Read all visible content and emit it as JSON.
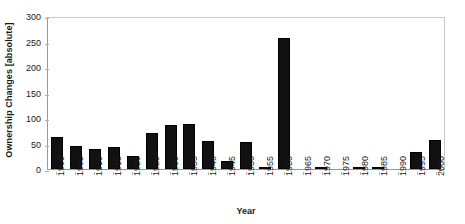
{
  "chart_data": {
    "type": "bar",
    "title": "",
    "xlabel": "Year",
    "ylabel": "Ownership Changes [absolute]",
    "categories": [
      "1900",
      "1905",
      "1910",
      "1915",
      "1920",
      "1925",
      "1930",
      "1935",
      "1940",
      "1945",
      "1950",
      "1955",
      "1960",
      "1965",
      "1970",
      "1975",
      "1980",
      "1985",
      "1990",
      "1995",
      "2000"
    ],
    "values": [
      63,
      46,
      39,
      43,
      25,
      71,
      86,
      89,
      55,
      15,
      53,
      2,
      257,
      0,
      2,
      0,
      2,
      2,
      0,
      33,
      56
    ],
    "ylim": [
      0,
      300
    ],
    "yticks": [
      0,
      50,
      100,
      150,
      200,
      250,
      300
    ],
    "ytick_labels": [
      "0",
      "50",
      "100",
      "150",
      "200",
      "250",
      "300"
    ],
    "grid": false,
    "legend": null,
    "series_color": "#111111"
  }
}
